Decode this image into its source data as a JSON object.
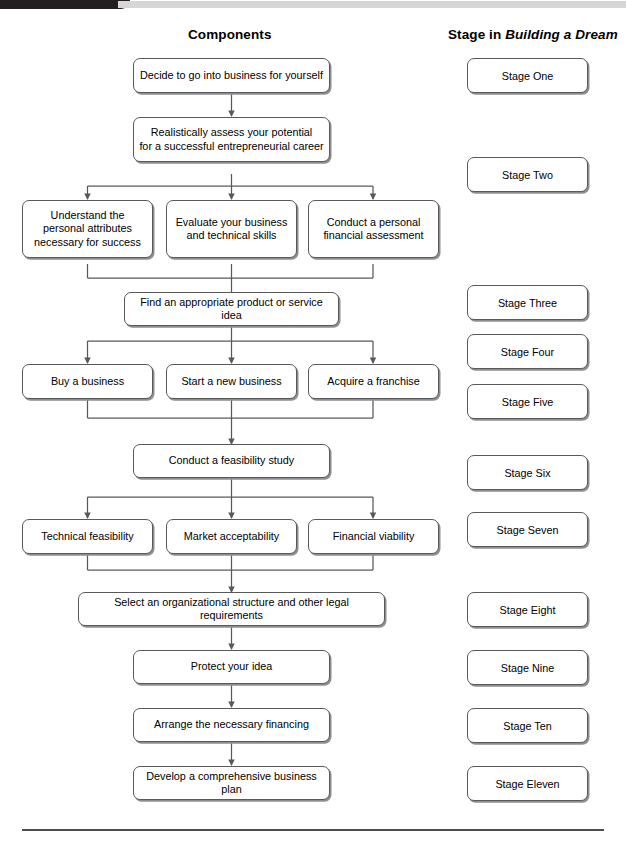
{
  "headers": {
    "components": "Components",
    "stage_prefix": "Stage in ",
    "stage_title_italic": "Building a Dream"
  },
  "colors": {
    "box_border": "#58595b",
    "box_shadow": "#8d8e90",
    "connector": "#58595b",
    "top_bar_dark": "#231f20",
    "top_bar_grey": "#d6d6d6",
    "footer_rule": "#4d4d4f"
  },
  "components": [
    {
      "id": "decide",
      "text": "Decide to go into business for yourself"
    },
    {
      "id": "assess_l1",
      "text": "Realistically assess your potential"
    },
    {
      "id": "assess_l2",
      "text": "for a successful entrepreneurial career"
    },
    {
      "id": "understand_l1",
      "text": "Understand the"
    },
    {
      "id": "understand_l2",
      "text": "personal attributes"
    },
    {
      "id": "understand_l3",
      "text": "necessary for success"
    },
    {
      "id": "evaluate_l1",
      "text": "Evaluate your business"
    },
    {
      "id": "evaluate_l2",
      "text": "and technical skills"
    },
    {
      "id": "conduct_l1",
      "text": "Conduct a personal"
    },
    {
      "id": "conduct_l2",
      "text": "financial assessment"
    },
    {
      "id": "find_idea",
      "text": "Find an appropriate product or service idea"
    },
    {
      "id": "buy",
      "text": "Buy a business"
    },
    {
      "id": "start",
      "text": "Start a new business"
    },
    {
      "id": "franchise",
      "text": "Acquire a franchise"
    },
    {
      "id": "feasibility",
      "text": "Conduct a feasibility study"
    },
    {
      "id": "technical",
      "text": "Technical feasibility"
    },
    {
      "id": "market",
      "text": "Market acceptability"
    },
    {
      "id": "financial",
      "text": "Financial viability"
    },
    {
      "id": "org_structure",
      "text": "Select an organizational structure and other legal requirements"
    },
    {
      "id": "protect",
      "text": "Protect your idea"
    },
    {
      "id": "financing",
      "text": "Arrange the necessary financing"
    },
    {
      "id": "bizplan",
      "text": "Develop a comprehensive business plan"
    }
  ],
  "stages": [
    {
      "id": "stage1",
      "label": "Stage One"
    },
    {
      "id": "stage2",
      "label": "Stage Two"
    },
    {
      "id": "stage3",
      "label": "Stage Three"
    },
    {
      "id": "stage4",
      "label": "Stage Four"
    },
    {
      "id": "stage5",
      "label": "Stage Five"
    },
    {
      "id": "stage6",
      "label": "Stage Six"
    },
    {
      "id": "stage7",
      "label": "Stage Seven"
    },
    {
      "id": "stage8",
      "label": "Stage Eight"
    },
    {
      "id": "stage9",
      "label": "Stage Nine"
    },
    {
      "id": "stage10",
      "label": "Stage Ten"
    },
    {
      "id": "stage11",
      "label": "Stage Eleven"
    }
  ]
}
